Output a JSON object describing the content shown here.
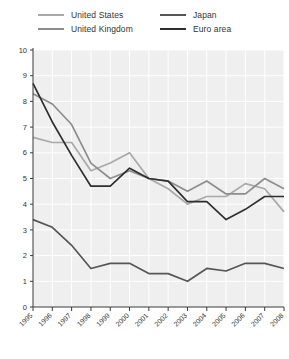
{
  "legend": {
    "entries": [
      {
        "label": "United States",
        "color": "#a9a9a9",
        "column": "left"
      },
      {
        "label": "United Kingdom",
        "color": "#8d8d8d",
        "column": "left"
      },
      {
        "label": "Japan",
        "color": "#565656",
        "column": "right"
      },
      {
        "label": "Euro area",
        "color": "#2f2f2f",
        "column": "right"
      }
    ]
  },
  "chart_data": {
    "type": "line",
    "title": "",
    "subtitle": "",
    "xlabel": "",
    "ylabel": "",
    "x": [
      1995,
      1996,
      1997,
      1998,
      1999,
      2000,
      2001,
      2002,
      2003,
      2004,
      2005,
      2006,
      2007,
      2008
    ],
    "categories": [
      "1995",
      "1996",
      "1997",
      "1998",
      "1999",
      "2000",
      "2001",
      "2002",
      "2003",
      "2004",
      "2005",
      "2006",
      "2007",
      "2008"
    ],
    "xlim": [
      1995,
      2008
    ],
    "ylim": [
      0,
      10
    ],
    "yticks": [
      0,
      1,
      2,
      3,
      4,
      5,
      6,
      7,
      8,
      9,
      10
    ],
    "xticks": [
      "1995",
      "1996",
      "1997",
      "1998",
      "1999",
      "2000",
      "2001",
      "2002",
      "2003",
      "2004",
      "2005",
      "2006",
      "2007",
      "2008"
    ],
    "grid": true,
    "grid_color": "#ffffff",
    "plot_background": "#efefef",
    "legend_position": "top",
    "series": [
      {
        "name": "United States",
        "color": "#a9a9a9",
        "values": [
          6.6,
          6.4,
          6.4,
          5.3,
          5.6,
          6.0,
          5.0,
          4.6,
          4.0,
          4.3,
          4.3,
          4.8,
          4.6,
          3.7
        ]
      },
      {
        "name": "United Kingdom",
        "color": "#8d8d8d",
        "values": [
          8.3,
          7.9,
          7.1,
          5.6,
          5.0,
          5.3,
          5.0,
          4.9,
          4.5,
          4.9,
          4.4,
          4.4,
          5.0,
          4.6
        ]
      },
      {
        "name": "Japan",
        "color": "#565656",
        "values": [
          3.4,
          3.1,
          2.4,
          1.5,
          1.7,
          1.7,
          1.3,
          1.3,
          1.0,
          1.5,
          1.4,
          1.7,
          1.7,
          1.5
        ]
      },
      {
        "name": "Euro area",
        "color": "#2f2f2f",
        "values": [
          8.7,
          7.2,
          5.9,
          4.7,
          4.7,
          5.4,
          5.0,
          4.9,
          4.1,
          4.1,
          3.4,
          3.8,
          4.3,
          4.3
        ]
      }
    ]
  }
}
